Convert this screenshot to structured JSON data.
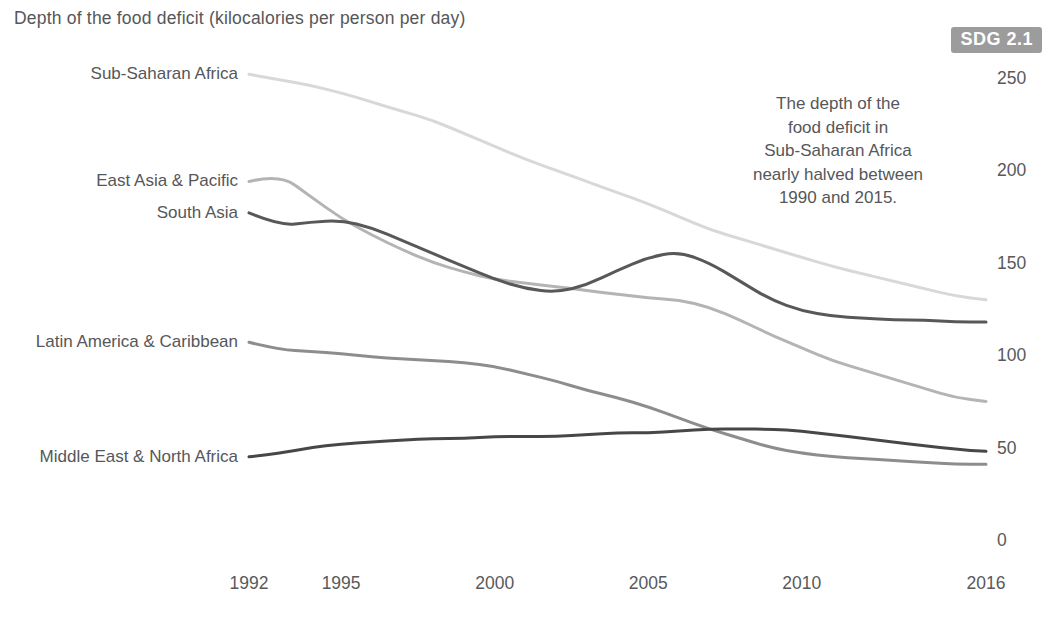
{
  "header": {
    "title": "Depth of the food deficit (kilocalories per person per day)",
    "badge": "SDG 2.1",
    "badge_bg": "#9c9c9c"
  },
  "annotation": {
    "lines": [
      "The depth of the",
      "food deficit in",
      "Sub-Saharan Africa",
      "nearly halved between",
      "1990 and 2015."
    ]
  },
  "colors": {
    "text": "#55575a",
    "tick_text": "#58595b"
  },
  "chart_data": {
    "type": "line",
    "title": "Depth of the food deficit (kilocalories per person per day)",
    "xlabel": "",
    "ylabel": "kilocalories per person per day",
    "grid": false,
    "legend_position": "left-inline-labels",
    "x_range": [
      1992,
      2016
    ],
    "ylim": [
      0,
      250
    ],
    "x_ticks": [
      1992,
      1995,
      2000,
      2005,
      2010,
      2016
    ],
    "y_ticks": [
      0,
      50,
      100,
      150,
      200,
      250
    ],
    "x": [
      1992,
      1993,
      1994,
      1995,
      1996,
      1997,
      1998,
      1999,
      2000,
      2001,
      2002,
      2003,
      2004,
      2005,
      2006,
      2007,
      2008,
      2009,
      2010,
      2011,
      2012,
      2013,
      2014,
      2015,
      2016
    ],
    "series": [
      {
        "name": "Sub-Saharan Africa",
        "color": "#d8d8d8",
        "values": [
          252,
          249,
          246,
          242,
          237,
          232,
          227,
          220,
          213,
          206,
          200,
          194,
          188,
          182,
          175,
          168,
          163,
          158,
          153,
          148,
          144,
          140,
          136,
          132,
          130
        ]
      },
      {
        "name": "East Asia & Pacific",
        "color": "#b4b4b4",
        "values": [
          194,
          198,
          186,
          174,
          165,
          157,
          150,
          145,
          141,
          139,
          137,
          135,
          133,
          131,
          130,
          126,
          119,
          111,
          104,
          97,
          92,
          87,
          82,
          77,
          75
        ]
      },
      {
        "name": "South Asia",
        "color": "#585858",
        "values": [
          177,
          170,
          172,
          173,
          169,
          162,
          155,
          148,
          141,
          136,
          134,
          138,
          146,
          153,
          156,
          150,
          140,
          130,
          124,
          121,
          120,
          119,
          119,
          118,
          118
        ]
      },
      {
        "name": "Latin America & Caribbean",
        "color": "#8d8d8d",
        "values": [
          107,
          103,
          102,
          101,
          99,
          98,
          97,
          96,
          94,
          90,
          86,
          81,
          77,
          72,
          66,
          60,
          55,
          50,
          47,
          45,
          44,
          43,
          42,
          41,
          41
        ]
      },
      {
        "name": "Middle East & North Africa",
        "color": "#474747",
        "values": [
          45,
          47,
          50,
          52,
          53,
          54,
          55,
          55,
          56,
          56,
          56,
          57,
          58,
          58,
          59,
          60,
          60,
          60,
          59,
          57,
          55,
          53,
          51,
          49,
          48
        ]
      }
    ]
  }
}
